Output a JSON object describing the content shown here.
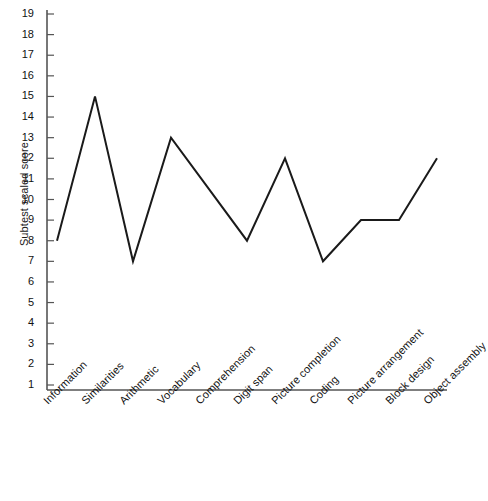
{
  "chart_data": {
    "type": "line",
    "title": "",
    "xlabel": "",
    "ylabel": "Subtest scaled score",
    "categories": [
      "Information",
      "Similarities",
      "Arithmetic",
      "Vocabulary",
      "Comprehension",
      "Digit span",
      "Picture completion",
      "Coding",
      "Picture arrangement",
      "Block design",
      "Object assembly"
    ],
    "values": [
      8,
      15,
      7,
      13,
      10.5,
      8,
      12,
      7,
      9,
      9,
      12
    ],
    "ylim": [
      1,
      19
    ],
    "ytick_labels": [
      "19",
      "18",
      "17",
      "16",
      "15",
      "14",
      "13",
      "12",
      "11",
      "10",
      "9",
      "8",
      "7",
      "6",
      "5",
      "4",
      "3",
      "2",
      "1"
    ],
    "grid": false,
    "legend": false,
    "line_color": "#1a1a1a",
    "axis_color": "#555555",
    "markers": false
  }
}
